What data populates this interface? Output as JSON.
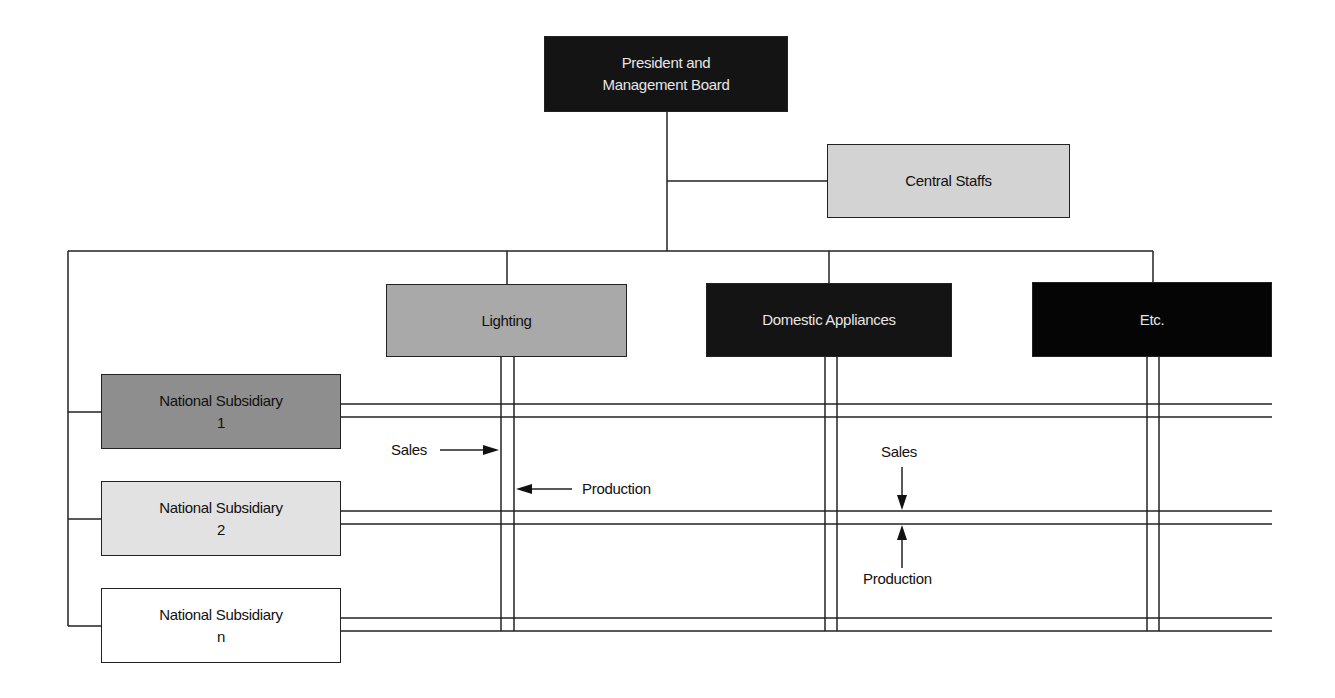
{
  "diagram": {
    "type": "matrix-organization-chart",
    "top": {
      "line1": "President and",
      "line2": "Management Board"
    },
    "staff": {
      "label": "Central Staffs"
    },
    "divisions": [
      {
        "label": "Lighting"
      },
      {
        "label": "Domestic Appliances"
      },
      {
        "label": "Etc."
      }
    ],
    "subsidiaries": [
      {
        "line1": "National Subsidiary",
        "line2": "1"
      },
      {
        "line1": "National Subsidiary",
        "line2": "2"
      },
      {
        "line1": "National Subsidiary",
        "line2": "n"
      }
    ],
    "annotations": {
      "left_sales": "Sales",
      "left_production": "Production",
      "right_sales": "Sales",
      "right_production": "Production"
    },
    "colors": {
      "top": "#141414",
      "staff": "#d3d3d3",
      "lighting": "#a9a9a9",
      "domestic": "#141414",
      "etc": "#050505",
      "subsidiary_1": "#8e8e8e",
      "subsidiary_2": "#e2e2e2",
      "subsidiary_n": "#ffffff"
    }
  }
}
